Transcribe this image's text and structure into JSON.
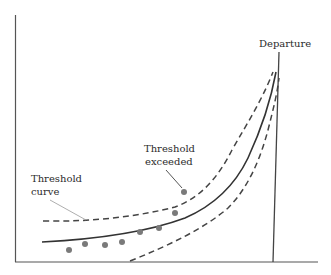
{
  "figure": {
    "labels": {
      "departure": "Departure",
      "threshold_exceeded_line1": "Threshold",
      "threshold_exceeded_line2": "exceeded",
      "threshold_curve_line1": "Threshold",
      "threshold_curve_line2": "curve"
    },
    "colors": {
      "axis": "#555555",
      "curve": "#333333",
      "dashed": "#444444",
      "dots": "#7a7a7a",
      "leader": "#999999"
    },
    "observations": [
      {
        "x": 69,
        "y": 250
      },
      {
        "x": 85,
        "y": 244
      },
      {
        "x": 105,
        "y": 245
      },
      {
        "x": 122,
        "y": 242
      },
      {
        "x": 140,
        "y": 232
      },
      {
        "x": 159,
        "y": 228
      },
      {
        "x": 175,
        "y": 213
      },
      {
        "x": 184,
        "y": 192
      }
    ]
  }
}
